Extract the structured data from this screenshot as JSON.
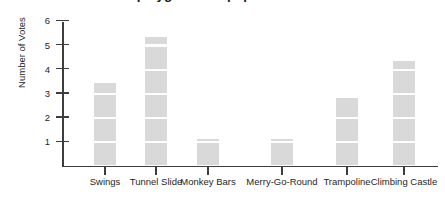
{
  "title": "Results of vote on playground equipment",
  "y_axis": {
    "label": "Number of Votes",
    "ticks": [
      "1",
      "2",
      "3",
      "4",
      "5",
      "6"
    ]
  },
  "x_axis": {
    "categories": [
      "Swings",
      "Tunnel Slide",
      "Monkey Bars",
      "Merry-Go-Round",
      "Trampoline",
      "Climbing Castle"
    ]
  },
  "colors": {
    "bar_fill": "#d9d9d9",
    "axis": "#3d3d3d",
    "text": "#1f1f1f"
  },
  "chart_data": {
    "type": "bar",
    "title": "Results of vote on playground equipment",
    "xlabel": "",
    "ylabel": "Number of Votes",
    "categories": [
      "Swings",
      "Tunnel Slide",
      "Monkey Bars",
      "Merry-Go-Round",
      "Trampoline",
      "Climbing Castle"
    ],
    "values": [
      3.5,
      5.4,
      1.2,
      1.2,
      2.9,
      4.4
    ],
    "ylim": [
      0,
      6.4
    ],
    "yticks": [
      1,
      2,
      3,
      4,
      5,
      6
    ],
    "grid": false,
    "legend": null
  }
}
